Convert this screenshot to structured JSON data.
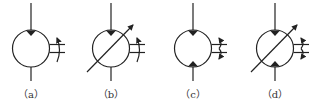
{
  "figure": {
    "stroke_color": "#222222",
    "symbols": [
      {
        "id": "a",
        "label": "（a）",
        "cx": 31,
        "variable": false,
        "bidirectional": false
      },
      {
        "id": "b",
        "label": "（b）",
        "cx": 111,
        "variable": true,
        "bidirectional": false
      },
      {
        "id": "c",
        "label": "（c）",
        "cx": 193,
        "variable": false,
        "bidirectional": true
      },
      {
        "id": "d",
        "label": "（d）",
        "cx": 275,
        "variable": true,
        "bidirectional": true
      }
    ]
  }
}
